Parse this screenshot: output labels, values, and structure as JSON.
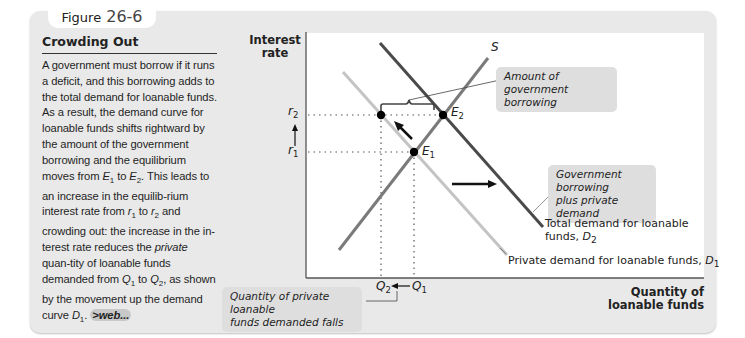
{
  "figure": {
    "label": "Figure",
    "number": "26-6"
  },
  "sidebar": {
    "title": "Crowding Out",
    "body_parts": [
      {
        "t": "A government must borrow if it runs a deficit, and this borrowing adds to the total demand for loanable funds. As a result, the demand curve for loanable funds shifts rightward by the amount of the government borrowing and the equilibrium moves from "
      },
      {
        "t": "E",
        "i": true,
        "sub": "1"
      },
      {
        "t": " to "
      },
      {
        "t": "E",
        "i": true,
        "sub": "2"
      },
      {
        "t": ". This leads to an increase in the equilib-rium interest rate from "
      },
      {
        "t": "r",
        "i": true,
        "sub": "1"
      },
      {
        "t": " to "
      },
      {
        "t": "r",
        "i": true,
        "sub": "2"
      },
      {
        "t": " and crowding out: the increase in the in-terest rate reduces the "
      },
      {
        "t": "private",
        "i": true
      },
      {
        "t": " quan-tity of loanable funds demanded from "
      },
      {
        "t": "Q",
        "i": true,
        "sub": "1"
      },
      {
        "t": " to "
      },
      {
        "t": "Q",
        "i": true,
        "sub": "2"
      },
      {
        "t": ", as shown by the movement up the demand curve "
      },
      {
        "t": "D",
        "i": true,
        "sub": "1"
      },
      {
        "t": ". "
      }
    ],
    "web_link": ">web..."
  },
  "chart_data": {
    "type": "line",
    "title": "Crowding Out",
    "ylabel": "Interest rate",
    "xlabel": "Quantity of loanable funds",
    "grid": false,
    "y_ticks": [
      {
        "label": "r2",
        "level": "high"
      },
      {
        "label": "r1",
        "level": "low"
      }
    ],
    "x_ticks": [
      {
        "label": "Q2",
        "position": "left"
      },
      {
        "label": "Q1",
        "position": "right"
      }
    ],
    "series": [
      {
        "name": "S",
        "label": "S",
        "kind": "supply",
        "color": "#7a7a7a",
        "points": [
          [
            33,
            217
          ],
          [
            182,
            25
          ]
        ]
      },
      {
        "name": "D1",
        "label": "Private demand for loanable funds, D1",
        "kind": "demand",
        "color": "#c4c4c4",
        "points": [
          [
            37,
            39
          ],
          [
            201,
            222
          ]
        ]
      },
      {
        "name": "D2",
        "label": "Total demand for loanable funds, D2",
        "kind": "demand",
        "color": "#4a4a4a",
        "points": [
          [
            74,
            10
          ],
          [
            237,
            194
          ]
        ]
      }
    ],
    "points": [
      {
        "name": "E1",
        "x": 108,
        "y": 119
      },
      {
        "name": "E2",
        "x": 137,
        "y": 82
      },
      {
        "name": "",
        "x": 75,
        "y": 82
      }
    ],
    "annotations": [
      "Amount of government borrowing",
      "Government borrowing plus private demand",
      "Quantity of private loanable funds demanded falls"
    ]
  },
  "labels": {
    "y_axis_line1": "Interest",
    "y_axis_line2": "rate",
    "x_axis_line1": "Quantity of",
    "x_axis_line2": "loanable funds",
    "S": "S",
    "E1": "E",
    "E1_sub": "1",
    "E2": "E",
    "E2_sub": "2",
    "r1": "r",
    "r1_sub": "1",
    "r2": "r",
    "r2_sub": "2",
    "Q1": "Q",
    "Q1_sub": "1",
    "Q2": "Q",
    "Q2_sub": "2",
    "d2_line1": "Total demand for loanable",
    "d2_line2": "funds, ",
    "d2_sym": "D",
    "d2_sub": "2",
    "d1_text": "Private demand for loanable funds, ",
    "d1_sym": "D",
    "d1_sub": "1",
    "callout_gov_line1": "Amount of government",
    "callout_gov_line2": "borrowing",
    "callout_plus_line1": "Government borrowing",
    "callout_plus_line2": "plus private demand",
    "callout_q_line1": "Quantity of private loanable",
    "callout_q_line2": "funds demanded falls"
  }
}
